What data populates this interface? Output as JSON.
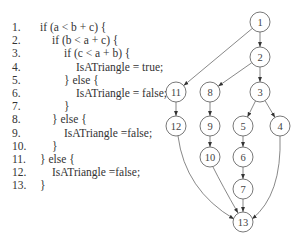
{
  "code": {
    "lines": [
      {
        "num": "1.",
        "indent": 0,
        "text": "if (a < b + c) {"
      },
      {
        "num": "2.",
        "indent": 1,
        "text": "if (b < a + c) {"
      },
      {
        "num": "3.",
        "indent": 2,
        "text": "if (c < a + b) {"
      },
      {
        "num": "4.",
        "indent": 3,
        "text": "IsATriangle = true;"
      },
      {
        "num": "5.",
        "indent": 2,
        "text": "} else {"
      },
      {
        "num": "6.",
        "indent": 3,
        "text": "IsATriangle = false;"
      },
      {
        "num": "7.",
        "indent": 2,
        "text": "}"
      },
      {
        "num": "8.",
        "indent": 1,
        "text": "} else {"
      },
      {
        "num": "9.",
        "indent": 2,
        "text": "IsATriangle =false;"
      },
      {
        "num": "10.",
        "indent": 1,
        "text": "}"
      },
      {
        "num": "11.",
        "indent": 0,
        "text": "} else {"
      },
      {
        "num": "12.",
        "indent": 1,
        "text": "IsATriangle =false;"
      },
      {
        "num": "13.",
        "indent": 0,
        "text": "}"
      }
    ]
  },
  "graph": {
    "nodes": [
      {
        "id": "1",
        "x": 260,
        "y": 22
      },
      {
        "id": "2",
        "x": 260,
        "y": 57
      },
      {
        "id": "3",
        "x": 260,
        "y": 92
      },
      {
        "id": "4",
        "x": 280,
        "y": 126
      },
      {
        "id": "5",
        "x": 243,
        "y": 126
      },
      {
        "id": "6",
        "x": 243,
        "y": 157
      },
      {
        "id": "7",
        "x": 243,
        "y": 189
      },
      {
        "id": "8",
        "x": 210,
        "y": 92
      },
      {
        "id": "9",
        "x": 210,
        "y": 126
      },
      {
        "id": "10",
        "x": 210,
        "y": 157
      },
      {
        "id": "11",
        "x": 176,
        "y": 92
      },
      {
        "id": "12",
        "x": 176,
        "y": 126
      },
      {
        "id": "13",
        "x": 243,
        "y": 222
      }
    ],
    "edges": [
      [
        "1",
        "2"
      ],
      [
        "1",
        "11"
      ],
      [
        "2",
        "3"
      ],
      [
        "2",
        "8"
      ],
      [
        "3",
        "5"
      ],
      [
        "3",
        "4"
      ],
      [
        "5",
        "6"
      ],
      [
        "6",
        "7"
      ],
      [
        "7",
        "13"
      ],
      [
        "8",
        "9"
      ],
      [
        "9",
        "10"
      ],
      [
        "10",
        "13"
      ],
      [
        "11",
        "12"
      ],
      [
        "12",
        "13"
      ],
      [
        "4",
        "13"
      ]
    ]
  }
}
